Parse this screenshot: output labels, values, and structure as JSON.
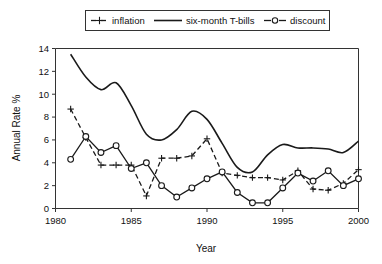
{
  "chart_data": {
    "type": "line",
    "title": "",
    "xlabel": "Year",
    "ylabel": "Annual Rate %",
    "xlim": [
      1980,
      2000
    ],
    "ylim": [
      0,
      14
    ],
    "xticks": [
      1980,
      1985,
      1990,
      1995,
      2000
    ],
    "xtick_labels": [
      "1980",
      "1985",
      "1990",
      "1995",
      "2000"
    ],
    "yticks": [
      0,
      2,
      4,
      6,
      8,
      10,
      12,
      14
    ],
    "ytick_labels": [
      "0",
      "2",
      "4",
      "6",
      "8",
      "10",
      "12",
      "14"
    ],
    "grid": false,
    "legend_position": "top-center",
    "x": [
      1981,
      1982,
      1983,
      1984,
      1985,
      1986,
      1987,
      1988,
      1989,
      1990,
      1991,
      1992,
      1993,
      1994,
      1995,
      1996,
      1997,
      1998,
      1999,
      2000
    ],
    "series": [
      {
        "name": "inflation",
        "marker": "plus",
        "linestyle": "dash-dot",
        "values": [
          8.7,
          6.2,
          3.8,
          3.8,
          3.8,
          1.1,
          4.4,
          4.4,
          4.6,
          6.1,
          3.1,
          2.9,
          2.7,
          2.7,
          2.5,
          3.3,
          1.7,
          1.6,
          2.2,
          3.4
        ]
      },
      {
        "name": "six-month T-bills",
        "marker": "none",
        "linestyle": "solid",
        "values": [
          13.5,
          11.5,
          10.4,
          11.0,
          9.0,
          6.5,
          6.0,
          6.9,
          8.5,
          7.8,
          5.7,
          3.6,
          3.2,
          4.7,
          5.6,
          5.3,
          5.3,
          5.2,
          4.9,
          5.9
        ]
      },
      {
        "name": "discount",
        "marker": "circle",
        "linestyle": "dash-circle",
        "values": [
          4.3,
          6.3,
          4.9,
          5.5,
          3.5,
          4.0,
          2.0,
          1.0,
          1.8,
          2.6,
          3.2,
          1.4,
          0.5,
          0.5,
          1.8,
          3.1,
          2.4,
          3.3,
          2.0,
          2.6
        ]
      }
    ]
  },
  "legend": {
    "entries": [
      {
        "label": "inflation",
        "sample": "dash-plus-dash"
      },
      {
        "label": "six-month T-bills",
        "sample": "solid-line"
      },
      {
        "label": "discount",
        "sample": "dash-circle-dash"
      }
    ]
  }
}
